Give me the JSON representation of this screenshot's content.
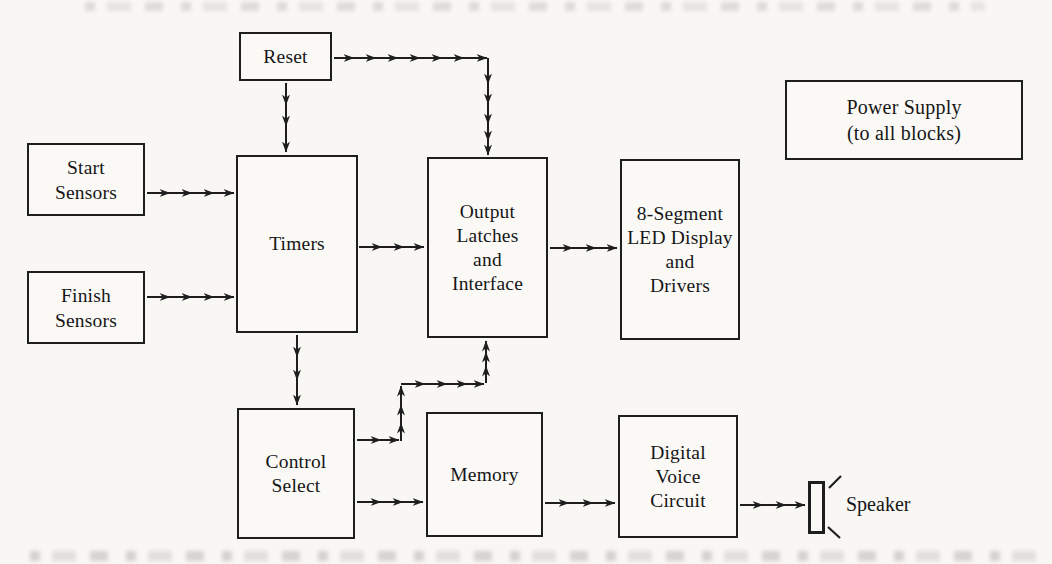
{
  "figure": {
    "type": "block-diagram",
    "blocks": {
      "reset": {
        "label": "Reset"
      },
      "start_sensors": {
        "label": "Start\nSensors"
      },
      "finish_sensors": {
        "label": "Finish\nSensors"
      },
      "timers": {
        "label": "Timers"
      },
      "output_latches": {
        "label": "Output\nLatches\nand\nInterface"
      },
      "led_display": {
        "label": "8-Segment\nLED Display\nand\nDrivers"
      },
      "power_supply": {
        "label": "Power Supply\n(to all blocks)"
      },
      "control_select": {
        "label": "Control\nSelect"
      },
      "memory": {
        "label": "Memory"
      },
      "digital_voice": {
        "label": "Digital\nVoice\nCircuit"
      },
      "speaker": {
        "label": "Speaker"
      }
    },
    "connections": [
      {
        "from": "Reset",
        "to": "Timers"
      },
      {
        "from": "Reset",
        "to": "Output Latches and Interface"
      },
      {
        "from": "Start Sensors",
        "to": "Timers"
      },
      {
        "from": "Finish Sensors",
        "to": "Timers"
      },
      {
        "from": "Timers",
        "to": "Output Latches and Interface"
      },
      {
        "from": "Timers",
        "to": "Control Select"
      },
      {
        "from": "Output Latches and Interface",
        "to": "8-Segment LED Display and Drivers"
      },
      {
        "from": "Control Select",
        "to": "Output Latches and Interface"
      },
      {
        "from": "Control Select",
        "to": "Memory"
      },
      {
        "from": "Memory",
        "to": "Digital Voice Circuit"
      },
      {
        "from": "Digital Voice Circuit",
        "to": "Speaker"
      }
    ],
    "colors": {
      "ink": "#1e1e1e",
      "paper": "#f8f7f4"
    }
  }
}
